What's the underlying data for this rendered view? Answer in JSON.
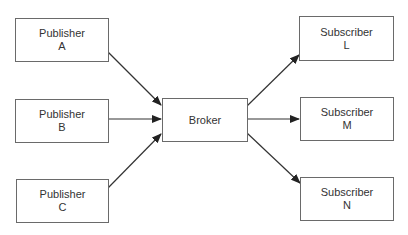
{
  "diagram": {
    "publishers": [
      {
        "id": "A",
        "line1": "Publisher",
        "line2": "A"
      },
      {
        "id": "B",
        "line1": "Publisher",
        "line2": "B"
      },
      {
        "id": "C",
        "line1": "Publisher",
        "line2": "C"
      }
    ],
    "broker": {
      "label": "Broker"
    },
    "subscribers": [
      {
        "id": "L",
        "line1": "Subscriber",
        "line2": "L"
      },
      {
        "id": "M",
        "line1": "Subscriber",
        "line2": "M"
      },
      {
        "id": "N",
        "line1": "Subscriber",
        "line2": "N"
      }
    ],
    "edges": [
      {
        "from": "Publisher A",
        "to": "Broker"
      },
      {
        "from": "Publisher B",
        "to": "Broker"
      },
      {
        "from": "Publisher C",
        "to": "Broker"
      },
      {
        "from": "Broker",
        "to": "Subscriber L"
      },
      {
        "from": "Broker",
        "to": "Subscriber M"
      },
      {
        "from": "Broker",
        "to": "Subscriber N"
      }
    ],
    "colors": {
      "stroke": "#333333",
      "border": "#6a6a6a",
      "text": "#333333"
    }
  }
}
